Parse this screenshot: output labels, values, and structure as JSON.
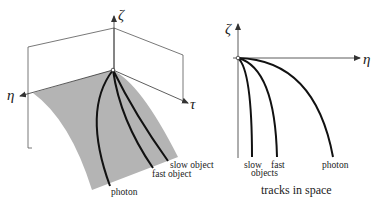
{
  "left_figure": {
    "axes": {
      "vertical": "ζ",
      "left": "η",
      "right": "τ"
    },
    "curve_labels": {
      "photon": "photon",
      "fast": "fast object",
      "slow": "slow object"
    },
    "surface_color": "#b4b4b4"
  },
  "right_figure": {
    "axes": {
      "vertical": "ζ",
      "horizontal": "η"
    },
    "curve_labels": {
      "slow": "slow",
      "fast": "fast",
      "objects": "objects",
      "photon": "photon"
    },
    "caption": "tracks in space"
  }
}
